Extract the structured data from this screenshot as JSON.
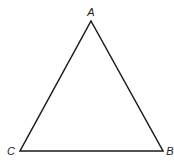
{
  "diagram": {
    "type": "triangle",
    "stroke_color": "#1a1a1a",
    "background": "#ffffff",
    "vertices": [
      {
        "label": "A",
        "x": 91,
        "y": 21,
        "label_x": 91,
        "label_y": 16
      },
      {
        "label": "B",
        "x": 163,
        "y": 151,
        "label_x": 170,
        "label_y": 155
      },
      {
        "label": "C",
        "x": 20,
        "y": 151,
        "label_x": 11,
        "label_y": 155
      }
    ]
  }
}
